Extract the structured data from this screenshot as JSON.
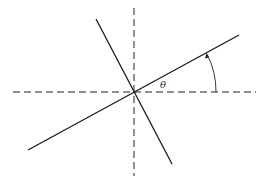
{
  "diagram": {
    "angle_label": "θ",
    "line_color": "#1a1a1a",
    "axis_color": "#222222",
    "center": [
      134,
      92
    ],
    "angle_degrees": 28.5
  }
}
